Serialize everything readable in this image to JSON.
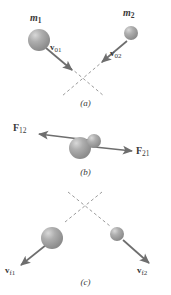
{
  "figure": {
    "background_color": "#ffffff",
    "ink_color": "#6e6e6e",
    "text_color": "#3a3a3a",
    "sphere_color": "#9a9a9a",
    "sphere_highlight_color": "#d6d6d6",
    "dashed_color": "#9b9b9b"
  },
  "panels": [
    {
      "id": "a",
      "caption": "(a)",
      "description": "Before collision: two masses approach each other",
      "masses": [
        {
          "name": "m1",
          "label": "m",
          "subscript": "1",
          "radius": 11,
          "cx": 39,
          "cy": 40
        },
        {
          "name": "m2",
          "label": "m",
          "subscript": "2",
          "radius": 7,
          "cx": 131,
          "cy": 33
        }
      ],
      "vectors": [
        {
          "name": "v01",
          "label": "v",
          "subscript": "01",
          "x1": 46,
          "y1": 48,
          "x2": 73,
          "y2": 71
        },
        {
          "name": "v02",
          "label": "v",
          "subscript": "02",
          "x1": 126,
          "y1": 40,
          "x2": 101,
          "y2": 63
        }
      ]
    },
    {
      "id": "b",
      "caption": "(b)",
      "description": "During collision: action-reaction force pair",
      "masses": [
        {
          "name": "m1-contact",
          "radius": 11,
          "cx": 80,
          "cy": 148
        },
        {
          "name": "m2-contact",
          "radius": 7,
          "cx": 94,
          "cy": 141
        }
      ],
      "forces": [
        {
          "name": "F12",
          "label": "F",
          "subscript": "12",
          "x1": 92,
          "y1": 140,
          "x2": 38,
          "y2": 134
        },
        {
          "name": "F21",
          "label": "F",
          "subscript": "21",
          "x1": 80,
          "y1": 145,
          "x2": 133,
          "y2": 151
        }
      ]
    },
    {
      "id": "c",
      "caption": "(c)",
      "description": "After collision: masses separate with final velocities",
      "masses": [
        {
          "name": "m1-final",
          "radius": 11,
          "cx": 52,
          "cy": 238
        },
        {
          "name": "m2-final",
          "radius": 7,
          "cx": 117,
          "cy": 234
        }
      ],
      "vectors": [
        {
          "name": "vf1",
          "label": "v",
          "subscript": "f1",
          "x1": 45,
          "y1": 245,
          "x2": 20,
          "y2": 266
        },
        {
          "name": "vf2",
          "label": "v",
          "subscript": "f2",
          "x1": 124,
          "y1": 241,
          "x2": 150,
          "y2": 264
        }
      ]
    }
  ],
  "labels": {
    "m1": "m",
    "m1_sub": "1",
    "m2": "m",
    "m2_sub": "2",
    "v01": "v",
    "v01_sub": "01",
    "v02": "v",
    "v02_sub": "02",
    "F12": "F",
    "F12_sub": "12",
    "F21": "F",
    "F21_sub": "21",
    "vf1": "v",
    "vf1_sub": "f1",
    "vf2": "v",
    "vf2_sub": "f2",
    "caption_a": "(a)",
    "caption_b": "(b)",
    "caption_c": "(c)"
  }
}
